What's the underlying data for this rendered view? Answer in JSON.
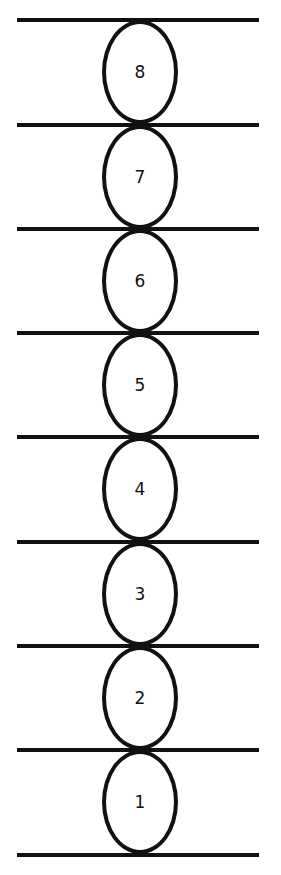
{
  "diagram": {
    "line_color": "#111111",
    "background": "#ffffff",
    "lines_y": [
      20,
      125,
      229,
      333,
      437,
      542,
      646,
      750,
      855
    ],
    "ovals": [
      {
        "label": "8"
      },
      {
        "label": "7"
      },
      {
        "label": "6"
      },
      {
        "label": "5"
      },
      {
        "label": "4"
      },
      {
        "label": "3"
      },
      {
        "label": "2"
      },
      {
        "label": "1"
      }
    ]
  }
}
